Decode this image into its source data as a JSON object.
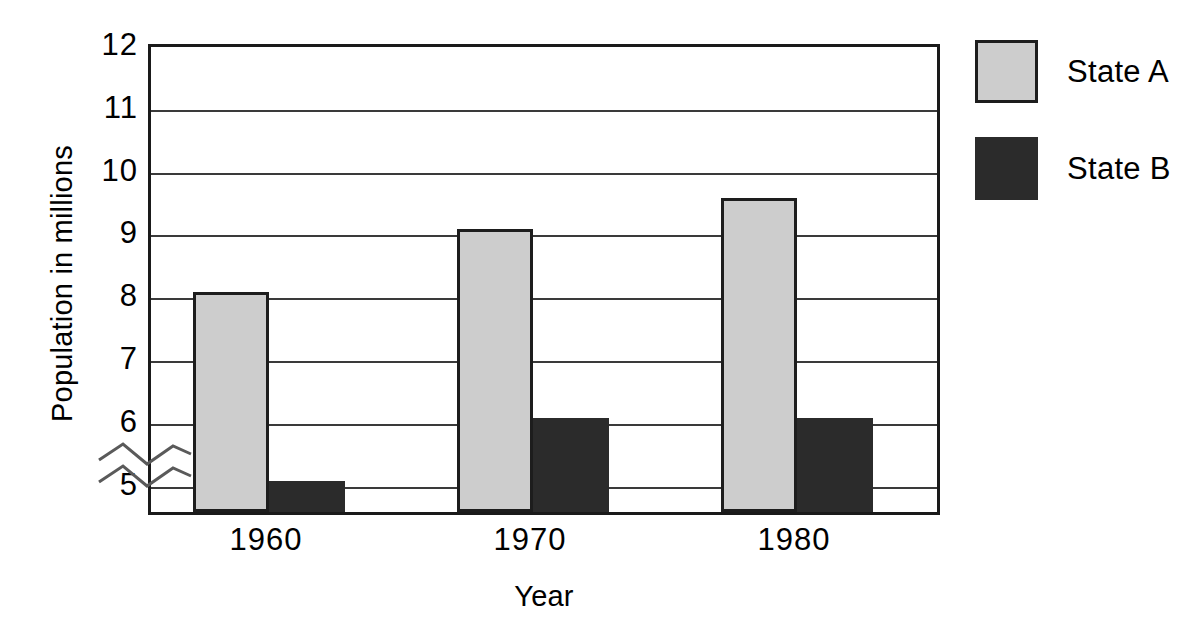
{
  "chart_data": {
    "type": "bar",
    "title": "",
    "xlabel": "Year",
    "ylabel": "Population in millions",
    "categories": [
      "1960",
      "1970",
      "1980"
    ],
    "series": [
      {
        "name": "State A",
        "values": [
          8,
          9,
          9.5
        ],
        "color": "#cdcdcd"
      },
      {
        "name": "State B",
        "values": [
          5,
          6,
          6
        ],
        "color": "#2b2b2b"
      }
    ],
    "ylim": [
      4.5,
      12
    ],
    "yticks": [
      12,
      11,
      10,
      9,
      8,
      7,
      6,
      5
    ],
    "ytick_labels": [
      "12",
      "11",
      "10",
      "9",
      "8",
      "7",
      "6",
      "5"
    ],
    "grid": true,
    "axis_break": true,
    "axis_break_note": "y-axis broken below 5",
    "legend_position": "right",
    "background_color": "#ffffff",
    "frame_color": "#1a1a1a"
  },
  "legend": {
    "entries": [
      {
        "label": "State A"
      },
      {
        "label": "State B"
      }
    ]
  },
  "icons": {
    "axis_break": "axis-break-squiggle-icon"
  }
}
